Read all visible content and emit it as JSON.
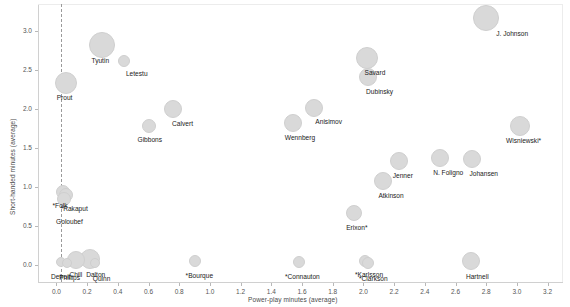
{
  "chart_data": {
    "type": "scatter",
    "title": "",
    "xlabel": "Power-play minutes (average)",
    "ylabel": "Short-handed minutes (average)",
    "xlim": [
      -0.12,
      3.3
    ],
    "ylim": [
      -0.22,
      3.35
    ],
    "xticks": [
      "0.0",
      "0.2",
      "0.4",
      "0.6",
      "0.8",
      "1.0",
      "1.2",
      "1.4",
      "1.6",
      "1.8",
      "2.0",
      "2.2",
      "2.4",
      "2.6",
      "2.8",
      "3.0",
      "3.2"
    ],
    "xtick_values": [
      0.0,
      0.2,
      0.4,
      0.6,
      0.8,
      1.0,
      1.2,
      1.4,
      1.6,
      1.8,
      2.0,
      2.2,
      2.4,
      2.6,
      2.8,
      3.0,
      3.2
    ],
    "yticks": [
      "0.0",
      "0.5",
      "1.0",
      "1.5",
      "2.0",
      "2.5",
      "3.0"
    ],
    "ytick_values": [
      0.0,
      0.5,
      1.0,
      1.5,
      2.0,
      2.5,
      3.0
    ],
    "grid": false,
    "legend": "none",
    "marker_color": "#d9d9d9",
    "marker_edge_color": "#cfcfcf",
    "reference_line": {
      "type": "vertical-dashed",
      "x": 0.03,
      "color": "#9a9a9a"
    },
    "size_encoding": "bubble area (total minutes played)",
    "points": [
      {
        "label": "J. Johnson",
        "x": 2.8,
        "y": 3.17,
        "size": 13,
        "label_dx": 10,
        "label_dy": 12
      },
      {
        "label": "Tyutin",
        "x": 0.3,
        "y": 2.82,
        "size": 13,
        "label_dx": -11,
        "label_dy": 12
      },
      {
        "label": "Savard",
        "x": 2.02,
        "y": 2.66,
        "size": 11,
        "label_dx": -2,
        "label_dy": 11
      },
      {
        "label": "Letestu",
        "x": 0.44,
        "y": 2.62,
        "size": 6,
        "label_dx": 2,
        "label_dy": 9
      },
      {
        "label": "Dubinsky",
        "x": 2.03,
        "y": 2.41,
        "size": 9,
        "label_dx": -2,
        "label_dy": 11
      },
      {
        "label": "Prout",
        "x": 0.06,
        "y": 2.33,
        "size": 11,
        "label_dx": -9,
        "label_dy": 11
      },
      {
        "label": "Anisimov",
        "x": 1.68,
        "y": 2.02,
        "size": 9,
        "label_dx": 1,
        "label_dy": 10
      },
      {
        "label": "Calvert",
        "x": 0.76,
        "y": 2.0,
        "size": 9,
        "label_dx": -1,
        "label_dy": 11
      },
      {
        "label": "Wennberg",
        "x": 1.54,
        "y": 1.82,
        "size": 9,
        "label_dx": -8,
        "label_dy": 11
      },
      {
        "label": "Gibbons",
        "x": 0.6,
        "y": 1.78,
        "size": 7,
        "label_dx": -11,
        "label_dy": 10
      },
      {
        "label": "Wisniewski*",
        "x": 3.02,
        "y": 1.78,
        "size": 10,
        "label_dx": -14,
        "label_dy": 11
      },
      {
        "label": "N. Foligno",
        "x": 2.5,
        "y": 1.37,
        "size": 9,
        "label_dx": -7,
        "label_dy": 11
      },
      {
        "label": "Johansen",
        "x": 2.71,
        "y": 1.36,
        "size": 9,
        "label_dx": -3,
        "label_dy": 11
      },
      {
        "label": "Jenner",
        "x": 2.23,
        "y": 1.33,
        "size": 9,
        "label_dx": -6,
        "label_dy": 11
      },
      {
        "label": "Atkinson",
        "x": 2.13,
        "y": 1.08,
        "size": 9,
        "label_dx": -5,
        "label_dy": 11
      },
      {
        "label": "*Folk",
        "x": 0.04,
        "y": 0.93,
        "size": 7,
        "label_dx": -10,
        "label_dy": 10
      },
      {
        "label": "*Rakaput",
        "x": 0.06,
        "y": 0.9,
        "size": 7,
        "label_dx": -5,
        "label_dy": 10
      },
      {
        "label": "Goloubef",
        "x": 0.05,
        "y": 0.84,
        "size": 7,
        "label_dx": -8,
        "label_dy": 19
      },
      {
        "label": "Erixon*",
        "x": 1.94,
        "y": 0.67,
        "size": 8,
        "label_dx": -8,
        "label_dy": 11
      },
      {
        "label": "*Bourque",
        "x": 0.9,
        "y": 0.05,
        "size": 6,
        "label_dx": -9,
        "label_dy": 11
      },
      {
        "label": "*Connauton",
        "x": 1.58,
        "y": 0.04,
        "size": 6,
        "label_dx": -14,
        "label_dy": 11
      },
      {
        "label": "*Karlsson",
        "x": 2.01,
        "y": 0.05,
        "size": 6,
        "label_dx": -10,
        "label_dy": 10
      },
      {
        "label": "*Clarkson",
        "x": 2.03,
        "y": 0.03,
        "size": 6,
        "label_dx": -9,
        "label_dy": 12
      },
      {
        "label": "Hartnell",
        "x": 2.7,
        "y": 0.05,
        "size": 9,
        "label_dx": -5,
        "label_dy": 12
      },
      {
        "label": "Dalton",
        "x": 0.22,
        "y": 0.08,
        "size": 10,
        "label_dx": -4,
        "label_dy": 12
      },
      {
        "label": "Chill",
        "x": 0.13,
        "y": 0.06,
        "size": 9,
        "label_dx": -7,
        "label_dy": 11
      },
      {
        "label": "Detroit",
        "x": 0.03,
        "y": 0.04,
        "size": 5,
        "label_dx": -10,
        "label_dy": 11
      },
      {
        "label": "Phillips",
        "x": 0.07,
        "y": 0.03,
        "size": 5,
        "label_dx": -8,
        "label_dy": 11
      },
      {
        "label": "Quinn",
        "x": 0.25,
        "y": 0.02,
        "size": 5,
        "label_dx": -2,
        "label_dy": 12
      }
    ]
  }
}
